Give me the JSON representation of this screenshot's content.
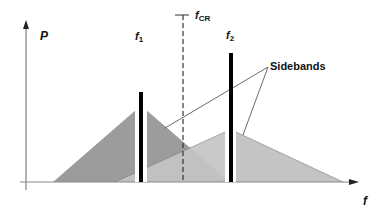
{
  "diagram": {
    "title": "",
    "labels": {
      "y_axis": "P",
      "x_axis": "f",
      "f1_main": "f",
      "f1_sub": "1",
      "f2_main": "f",
      "f2_sub": "2",
      "fcr_main": "f",
      "fcr_sub": "CR",
      "sidebands": "Sidebands"
    },
    "colors": {
      "background": "#ffffff",
      "axis": "#555555",
      "dark_sideband": "#9a9a9a",
      "light_sideband": "#c2c2c2",
      "carrier_bar": "#000000",
      "leader_line": "#444444",
      "dashed_line": "#333333"
    },
    "shapes": {
      "dark_triangle": "53,182 137,108 137,182",
      "dark_triangle_right": "145,108 230,182 145,182",
      "light_triangle_left": "115,182 225,132 225,182",
      "light_triangle_right": "236,132 343,182 236,182"
    }
  }
}
